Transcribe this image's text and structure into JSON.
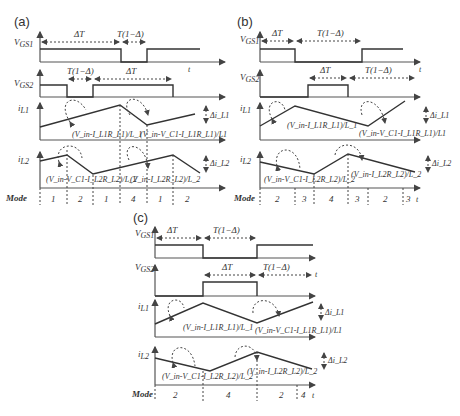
{
  "panels": {
    "a": {
      "label": "(a)",
      "vgs1": "V_GS1",
      "vgs2": "V_GS2",
      "il1": "i_L1",
      "il2": "i_L2",
      "vgs1_spans": [
        "ΔT",
        "T(1−Δ)"
      ],
      "vgs2_spans": [
        "T(1−Δ)",
        "ΔT"
      ],
      "il1_slopes": [
        "(V_in-I_L1R_L1)/L_1",
        "(V_in-V_C1-I_L1R_L1)/L1"
      ],
      "il2_slopes": [
        "(V_in-V_C1-I_L2R_L2)/L_2",
        "(V_in-I_L2R_L2)/L_2"
      ],
      "ripple1": "Δi_L1",
      "ripple2": "Δi_L2",
      "mode_label": "Mode",
      "modes": [
        "1",
        "2",
        "1",
        "4",
        "1",
        "2"
      ],
      "t": "t"
    },
    "b": {
      "label": "(b)",
      "vgs1_spans": [
        "ΔT",
        "T(1−Δ)"
      ],
      "vgs2_spans": [
        "ΔT",
        "T(1−Δ)"
      ],
      "il1_slopes": [
        "(V_in-I_L1R_L1)/L_1",
        "(V_in-V_C1-I_L1R_L1)/L1"
      ],
      "il2_slopes": [
        "(V_in-V_C1-I_L2R_L2)/L_2",
        "(V_in-I_L2R_L2)/L_2"
      ],
      "mode_label": "Mode",
      "modes": [
        "2",
        "3",
        "4",
        "3",
        "2",
        "3"
      ]
    },
    "c": {
      "label": "(c)",
      "vgs1_spans": [
        "ΔT",
        "T(1−Δ)"
      ],
      "vgs2_spans": [
        "ΔT",
        "T(1−Δ)"
      ],
      "il1_slopes": [
        "(V_in-I_L1R_L1)/L_1",
        "(V_in-V_C1-I_L1R_L1)/L1"
      ],
      "il2_slopes": [
        "(V_in-V_C1-I_L2R_L2)/L_2",
        "(V_in-I_L2R_L2)/L_2"
      ],
      "mode_label": "Mode",
      "modes": [
        "2",
        "4",
        "2",
        "4"
      ]
    }
  },
  "colors": {
    "line": "#333333",
    "background": "#ffffff"
  }
}
